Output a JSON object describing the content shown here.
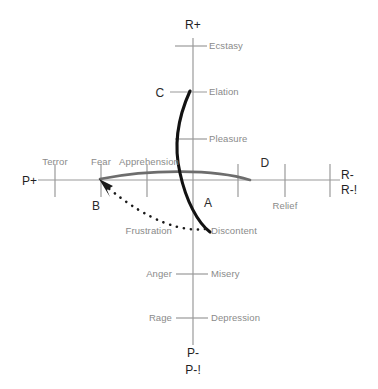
{
  "diagram": {
    "background": "#ffffff",
    "axis_color": "#8f8f8f",
    "curve_color": "#1a1a1a",
    "arc_color": "#5a5a5a",
    "label_color": "#8a8a8a",
    "point_label_color": "#2b2b2b"
  },
  "axis_endpoints": [
    {
      "id": "r-plus",
      "text": "R+",
      "x": 193,
      "y": 25,
      "align": "center"
    },
    {
      "id": "p-plus",
      "text": "P+",
      "x": 22,
      "y": 181,
      "align": "left"
    },
    {
      "id": "r-minus",
      "text": "R-",
      "x": 341,
      "y": 175,
      "align": "left"
    },
    {
      "id": "r-minus-excl",
      "text": "R-!",
      "x": 341,
      "y": 190,
      "align": "left"
    },
    {
      "id": "p-minus",
      "text": "P-",
      "x": 193,
      "y": 353,
      "align": "center"
    },
    {
      "id": "p-minus-excl",
      "text": "P-!",
      "x": 193,
      "y": 370,
      "align": "center"
    }
  ],
  "emotion_labels": [
    {
      "id": "ecstasy",
      "text": "Ecstasy",
      "x": 209,
      "y": 46,
      "align": "left"
    },
    {
      "id": "elation",
      "text": "Elation",
      "x": 209,
      "y": 92,
      "align": "left"
    },
    {
      "id": "pleasure",
      "text": "Pleasure",
      "x": 209,
      "y": 139,
      "align": "left"
    },
    {
      "id": "terror",
      "text": "Terror",
      "x": 55,
      "y": 162,
      "align": "center"
    },
    {
      "id": "fear",
      "text": "Fear",
      "x": 101,
      "y": 162,
      "align": "center"
    },
    {
      "id": "apprehension",
      "text": "Apprehension",
      "x": 147,
      "y": 162,
      "align": "center"
    },
    {
      "id": "relief",
      "text": "Relief",
      "x": 285,
      "y": 206,
      "align": "center"
    },
    {
      "id": "frustration",
      "text": "Frustration",
      "x": 172,
      "y": 231,
      "align": "right"
    },
    {
      "id": "discontent",
      "text": "Discontent",
      "x": 211,
      "y": 231,
      "align": "left"
    },
    {
      "id": "anger",
      "text": "Anger",
      "x": 172,
      "y": 274,
      "align": "right"
    },
    {
      "id": "misery",
      "text": "Misery",
      "x": 211,
      "y": 274,
      "align": "left"
    },
    {
      "id": "rage",
      "text": "Rage",
      "x": 172,
      "y": 318,
      "align": "right"
    },
    {
      "id": "depression",
      "text": "Depression",
      "x": 211,
      "y": 318,
      "align": "left"
    }
  ],
  "point_labels": [
    {
      "id": "point-a",
      "text": "A",
      "x": 208,
      "y": 203
    },
    {
      "id": "point-b",
      "text": "B",
      "x": 96,
      "y": 206
    },
    {
      "id": "point-c",
      "text": "C",
      "x": 160,
      "y": 93
    },
    {
      "id": "point-d",
      "text": "D",
      "x": 265,
      "y": 163
    }
  ],
  "geometry": {
    "vertical_axis": {
      "x": 193,
      "y1": 38,
      "y2": 345
    },
    "horizontal_axis": {
      "y": 180,
      "x1": 38,
      "x2": 340
    },
    "vertical_ticks_y": [
      46,
      92,
      139,
      274,
      318
    ],
    "vertical_tick_halfwidth_left": 18,
    "vertical_tick_halfwidth_right": 14,
    "horizontal_ticks_x": [
      55,
      101,
      147,
      238,
      285,
      330
    ],
    "horizontal_tick_halfheight": 17,
    "bold_vertical_curve": "M 190 91 C 176 125, 176 150, 180 172 C 186 200, 198 222, 209 232",
    "arc_horizontal_curve": "M 100 179 C 150 169, 215 169, 250 180",
    "dotted_arrow_path": "M 206 229 C 185 231, 150 222, 104 184",
    "arrow_tip": {
      "x": 100,
      "y": 180
    }
  }
}
